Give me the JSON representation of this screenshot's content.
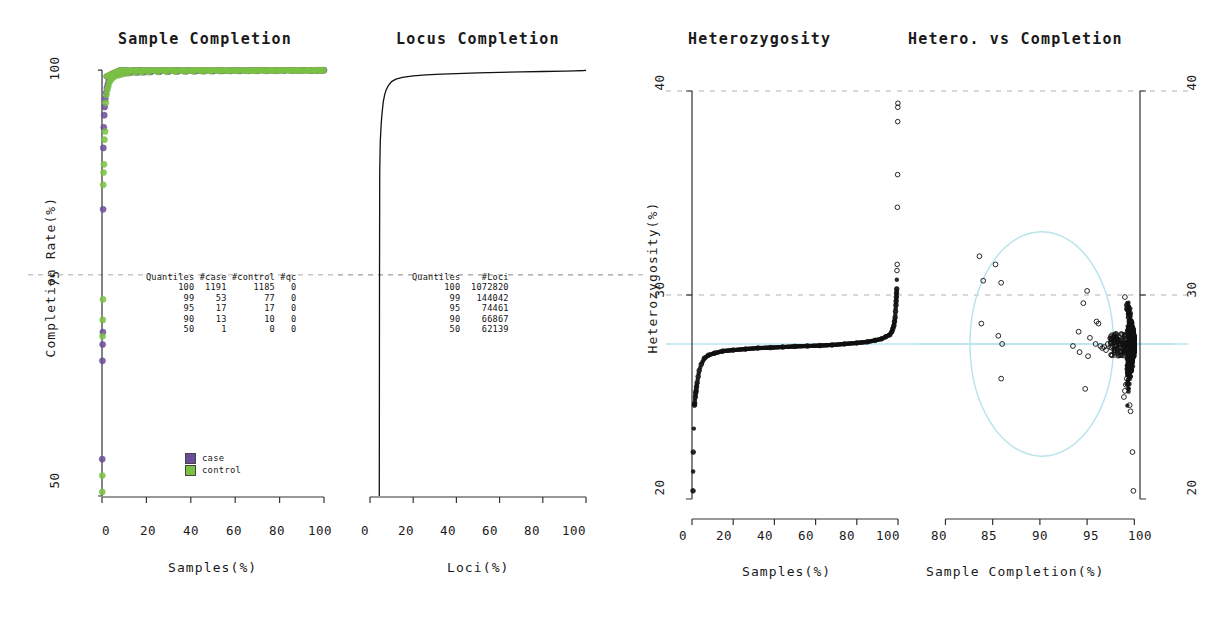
{
  "figure": {
    "background": "#ffffff",
    "case_color": "#6b4c9a",
    "control_color": "#7ac143",
    "highlight_color": "#b9e4ec"
  },
  "panels": {
    "sample_completion": {
      "title": "Sample Completion",
      "xlabel": "Samples(%)",
      "ylabel": "Completion Rate(%)",
      "xticks": [
        "0",
        "20",
        "40",
        "60",
        "80",
        "100"
      ],
      "yticks": [
        "50",
        "75",
        "100"
      ],
      "table": {
        "headers": [
          "Quantiles",
          "#case",
          "#control",
          "#qc"
        ],
        "rows": [
          [
            "100",
            "1191",
            "1185",
            "0"
          ],
          [
            "99",
            "53",
            "77",
            "0"
          ],
          [
            "95",
            "17",
            "17",
            "0"
          ],
          [
            "90",
            "13",
            "10",
            "0"
          ],
          [
            "50",
            "1",
            "0",
            "0"
          ]
        ]
      },
      "legend": [
        {
          "label": "case",
          "color": "#6b4c9a"
        },
        {
          "label": "control",
          "color": "#7ac143"
        }
      ]
    },
    "locus_completion": {
      "title": "Locus Completion",
      "xlabel": "Loci(%)",
      "xticks": [
        "0",
        "20",
        "40",
        "60",
        "80",
        "100"
      ],
      "table": {
        "headers": [
          "Quantiles",
          "#Loci"
        ],
        "rows": [
          [
            "100",
            "1072820"
          ],
          [
            "99",
            "144042"
          ],
          [
            "95",
            "74461"
          ],
          [
            "90",
            "66867"
          ],
          [
            "50",
            "62139"
          ]
        ]
      }
    },
    "heterozygosity": {
      "title": "Heterozygosity",
      "xlabel": "Samples(%)",
      "ylabel": "Heterozygosity(%)",
      "xticks": [
        "0",
        "20",
        "40",
        "60",
        "80",
        "100"
      ],
      "yticks": [
        "20",
        "30",
        "40"
      ]
    },
    "hetero_vs_completion": {
      "title": "Hetero. vs Completion",
      "xlabel": "Sample Completion(%)",
      "xticks": [
        "80",
        "85",
        "90",
        "95",
        "100"
      ],
      "yticks": [
        "20",
        "30",
        "40"
      ]
    }
  },
  "chart_data": [
    {
      "type": "scatter",
      "title": "Sample Completion",
      "xlabel": "Samples(%)",
      "ylabel": "Completion Rate(%)",
      "xlim": [
        0,
        100
      ],
      "ylim": [
        48,
        100.5
      ],
      "grid": true,
      "gridlines_y": [
        75
      ],
      "legend": [
        "case",
        "control"
      ],
      "legend_position": "bottom-left",
      "description": "Sorted per-sample completion rate; near-100% plateau for >98% of samples with a short low tail at x~0.",
      "series": [
        {
          "name": "case",
          "color": "#6b4c9a",
          "x": [
            0.1,
            0.2,
            0.3,
            0.4,
            0.5,
            0.6,
            0.8,
            1.0,
            1.2,
            1.5,
            1.8,
            2.2,
            2.6,
            3.0,
            3.6,
            4.2,
            5.0,
            6.0,
            7.5,
            9,
            11,
            13,
            16,
            19,
            22,
            26,
            30,
            34,
            38,
            42,
            46,
            50,
            54,
            58,
            62,
            66,
            70,
            74,
            78,
            82,
            86,
            90,
            94,
            97,
            99,
            100
          ],
          "y": [
            52.5,
            64.5,
            66.5,
            68.0,
            83.0,
            90.5,
            93.0,
            94.5,
            95.5,
            96.5,
            97.2,
            97.8,
            98.2,
            98.6,
            98.9,
            99.1,
            99.3,
            99.4,
            99.5,
            99.6,
            99.65,
            99.7,
            99.72,
            99.75,
            99.78,
            99.8,
            99.82,
            99.84,
            99.85,
            99.86,
            99.87,
            99.88,
            99.89,
            99.9,
            99.9,
            99.91,
            99.92,
            99.92,
            99.93,
            99.94,
            99.94,
            99.95,
            99.96,
            99.97,
            99.98,
            99.99
          ]
        },
        {
          "name": "control",
          "color": "#7ac143",
          "x": [
            0.1,
            0.15,
            0.25,
            0.35,
            0.45,
            0.55,
            0.7,
            0.9,
            1.1,
            1.4,
            1.7,
            2.0,
            2.4,
            2.8,
            3.3,
            3.9,
            4.6,
            5.5,
            7.0,
            8.5,
            10,
            12,
            15,
            18,
            21,
            25,
            29,
            33,
            37,
            41,
            45,
            49,
            53,
            57,
            61,
            65,
            69,
            73,
            77,
            81,
            85,
            89,
            93,
            96,
            98,
            99.5
          ],
          "y": [
            48.5,
            50.5,
            67.5,
            69.5,
            72.0,
            86.0,
            87.5,
            88.5,
            91.5,
            92.5,
            96.0,
            97.0,
            97.6,
            98.0,
            98.5,
            98.8,
            99.0,
            99.2,
            99.35,
            99.45,
            99.55,
            99.62,
            99.68,
            99.71,
            99.74,
            99.77,
            99.79,
            99.81,
            99.83,
            99.85,
            99.86,
            99.87,
            99.88,
            99.89,
            99.9,
            99.9,
            99.91,
            99.92,
            99.93,
            99.93,
            99.94,
            99.95,
            99.96,
            99.97,
            99.98,
            99.99
          ]
        }
      ]
    },
    {
      "type": "line",
      "title": "Locus Completion",
      "xlabel": "Loci(%)",
      "ylabel": "Completion Rate(%)",
      "xlim": [
        0,
        100
      ],
      "ylim": [
        48,
        100.5
      ],
      "grid": true,
      "gridlines_y": [
        75
      ],
      "description": "Sorted per-locus completion rate: a vertical rise from 50% up to ~88% at x~4.5, then a sharp knee and a flat plateau approaching 100%.",
      "x": [
        4.3,
        4.4,
        4.5,
        4.6,
        4.7,
        4.8,
        5.0,
        5.2,
        5.5,
        5.8,
        6.2,
        6.8,
        7.5,
        8.5,
        10,
        12,
        15,
        20,
        26,
        33,
        40,
        50,
        60,
        70,
        80,
        90,
        95,
        99,
        100
      ],
      "y": [
        48.0,
        74.0,
        87.5,
        89.0,
        90.5,
        91.5,
        92.5,
        93.5,
        94.5,
        95.3,
        96.2,
        97.0,
        97.6,
        98.1,
        98.6,
        98.9,
        99.1,
        99.3,
        99.42,
        99.5,
        99.57,
        99.65,
        99.72,
        99.78,
        99.83,
        99.88,
        99.91,
        99.95,
        99.97
      ]
    },
    {
      "type": "scatter",
      "title": "Heterozygosity",
      "xlabel": "Samples(%)",
      "ylabel": "Heterozygosity(%)",
      "xlim": [
        0,
        100
      ],
      "ylim": [
        20,
        40
      ],
      "grid": true,
      "gridlines_y": [
        30,
        40
      ],
      "mean_line": 27.6,
      "mean_line_color": "#b9e4ec",
      "description": "Sorted heterozygosity per sample: flat band near 27.5% across the bulk, low tail below 25% at x~0 and a high tail with outliers above 30% at x~100.",
      "x": [
        0.5,
        0.6,
        1.2,
        1.3,
        1.6,
        1.8,
        2.0,
        2.2,
        2.5,
        3.0,
        3.5,
        4.5,
        6,
        8,
        11,
        15,
        20,
        26,
        32,
        38,
        44,
        50,
        56,
        62,
        68,
        74,
        80,
        85,
        89,
        92,
        94,
        96,
        97,
        97.5,
        98,
        98.3,
        98.6,
        98.8,
        99.0,
        99.1,
        99.2,
        99.3,
        99.4,
        99.5,
        99.6,
        99.7,
        99.8,
        99.85,
        99.9,
        99.95
      ],
      "y": [
        20.4,
        22.3,
        24.6,
        24.7,
        25.0,
        25.2,
        25.3,
        25.5,
        25.7,
        26.0,
        26.3,
        26.6,
        26.9,
        27.05,
        27.15,
        27.25,
        27.3,
        27.35,
        27.4,
        27.42,
        27.45,
        27.48,
        27.5,
        27.52,
        27.55,
        27.6,
        27.65,
        27.7,
        27.78,
        27.85,
        27.95,
        28.05,
        28.2,
        28.35,
        28.5,
        28.7,
        28.9,
        29.2,
        29.5,
        29.7,
        29.9,
        30.1,
        30.3,
        31.2,
        31.5,
        34.3,
        35.9,
        38.5,
        39.2,
        39.4
      ]
    },
    {
      "type": "scatter",
      "title": "Hetero. vs Completion",
      "xlabel": "Sample Completion(%)",
      "ylabel": "Heterozygosity(%)",
      "xlim": [
        79,
        100.6
      ],
      "ylim": [
        20,
        40
      ],
      "grid": true,
      "gridlines_y": [
        30,
        40
      ],
      "mean_line": 27.6,
      "mean_line_color": "#b9e4ec",
      "highlight_circle": {
        "cx": 90.2,
        "cy": 27.6,
        "rx": 7.6,
        "ry": 5.5,
        "color": "#b9e4ec"
      },
      "description": "Heterozygosity against sample completion: a dense vertical cloud at completion ~99-100% centred on 27.5%, plus scattered low-completion outliers inside the highlighted circle.",
      "points": [
        [
          83.6,
          31.9
        ],
        [
          85.3,
          31.5
        ],
        [
          84.0,
          30.7
        ],
        [
          85.9,
          30.6
        ],
        [
          95.0,
          30.2
        ],
        [
          94.6,
          29.6
        ],
        [
          83.8,
          28.6
        ],
        [
          85.6,
          28.0
        ],
        [
          96.0,
          28.7
        ],
        [
          96.2,
          28.6
        ],
        [
          94.1,
          28.2
        ],
        [
          95.3,
          27.9
        ],
        [
          95.9,
          27.6
        ],
        [
          96.4,
          27.5
        ],
        [
          96.6,
          27.4
        ],
        [
          96.8,
          27.45
        ],
        [
          97.0,
          27.3
        ],
        [
          97.2,
          27.6
        ],
        [
          86.0,
          27.6
        ],
        [
          93.5,
          27.5
        ],
        [
          94.2,
          27.2
        ],
        [
          95.1,
          27.0
        ],
        [
          85.9,
          25.9
        ],
        [
          94.8,
          25.4
        ],
        [
          99.0,
          29.9
        ],
        [
          99.2,
          29.5
        ],
        [
          99.4,
          28.9
        ],
        [
          99.5,
          28.6
        ],
        [
          99.6,
          28.4
        ],
        [
          99.7,
          28.2
        ],
        [
          99.8,
          28.0
        ],
        [
          99.85,
          27.9
        ],
        [
          99.9,
          27.8
        ],
        [
          99.95,
          27.7
        ],
        [
          100.0,
          27.6
        ],
        [
          100.0,
          27.5
        ],
        [
          99.9,
          27.4
        ],
        [
          99.8,
          27.3
        ],
        [
          99.7,
          27.2
        ],
        [
          99.6,
          27.0
        ],
        [
          99.5,
          26.8
        ],
        [
          99.4,
          26.5
        ],
        [
          99.3,
          26.2
        ],
        [
          99.2,
          25.9
        ],
        [
          99.1,
          25.6
        ],
        [
          99.0,
          25.3
        ],
        [
          98.9,
          25.0
        ],
        [
          99.5,
          24.6
        ],
        [
          99.6,
          24.3
        ],
        [
          99.8,
          22.3
        ],
        [
          99.9,
          20.4
        ]
      ]
    }
  ]
}
